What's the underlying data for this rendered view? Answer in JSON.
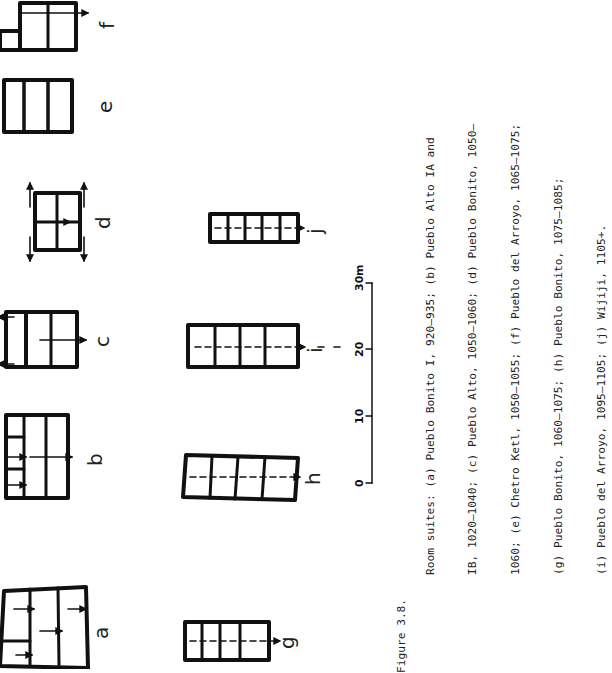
{
  "figure": {
    "number_label": "Figure 3.8.",
    "caption_lines": [
      "Room suites:  (a) Pueblo Bonito I, 920–935; (b) Pueblo Alto IA and",
      "IB, 1020–1040; (c) Pueblo Alto, 1050–1060; (d) Pueblo Bonito, 1050–",
      "1060; (e) Chetro Ketl, 1050–1055; (f) Pueblo del Arroyo, 1065–1075;",
      "(g) Pueblo Bonito, 1060–1075; (h) Pueblo Bonito, 1075–1085;",
      "(i) Pueblo del Arroyo, 1095–1105; (j) Wijiji, 1105+."
    ],
    "panels": [
      {
        "id": "a",
        "label": "a",
        "site": "Pueblo Bonito I",
        "dates": "920–935"
      },
      {
        "id": "b",
        "label": "b",
        "site": "Pueblo Alto IA and IB",
        "dates": "1020–1040"
      },
      {
        "id": "c",
        "label": "c",
        "site": "Pueblo Alto",
        "dates": "1050–1060"
      },
      {
        "id": "d",
        "label": "d",
        "site": "Pueblo Bonito",
        "dates": "1050–1060"
      },
      {
        "id": "e",
        "label": "e",
        "site": "Chetro Ketl",
        "dates": "1050–1055"
      },
      {
        "id": "f",
        "label": "f",
        "site": "Pueblo del Arroyo",
        "dates": "1065–1075"
      },
      {
        "id": "g",
        "label": "g",
        "site": "Pueblo Bonito",
        "dates": "1060–1075"
      },
      {
        "id": "h",
        "label": "h",
        "site": "Pueblo Bonito",
        "dates": "1075–1085"
      },
      {
        "id": "i",
        "label": "i",
        "site": "Pueblo del Arroyo",
        "dates": "1095–1105"
      },
      {
        "id": "j",
        "label": "j",
        "site": "Wijiji",
        "dates": "1105+"
      }
    ],
    "scale_bar": {
      "ticks": [
        "0",
        "10",
        "20",
        "30"
      ],
      "unit": "m"
    }
  }
}
